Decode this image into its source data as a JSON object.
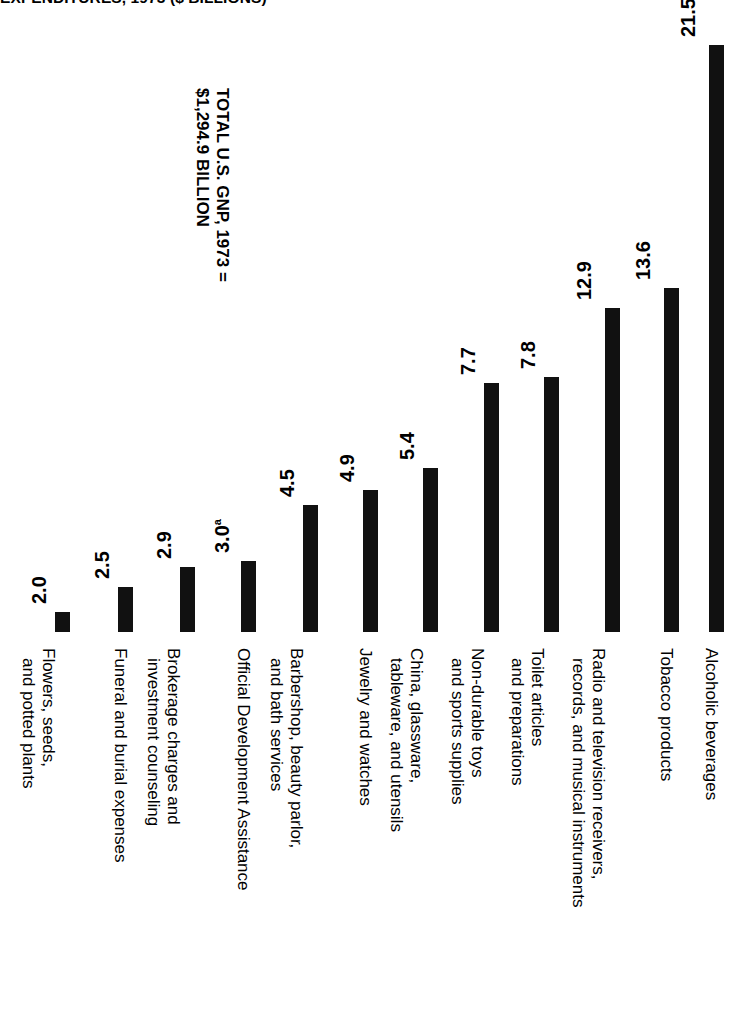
{
  "title": "EXPENDITURES, 1973 ($ BILLIONS)",
  "annotation": {
    "line1": "TOTAL U.S. GNP, 1973 =",
    "line2": "$1,294.9 BILLION"
  },
  "chart_data": {
    "type": "bar",
    "title": "EXPENDITURES, 1973 ($ BILLIONS)",
    "xlabel": "",
    "ylabel": "$ Billions",
    "grid": false,
    "legend": "none",
    "orientation": "vertical",
    "value_labels_rotated": true,
    "categories": [
      "Flowers, seeds, and potted plants",
      "Funeral and burial expenses",
      "Brokerage charges and investment counseling",
      "Official Development Assistance",
      "Barbershop, beauty parlor, and bath services",
      "Jewelry and watches",
      "China, glassware, tableware, and utensils",
      "Non-durable toys and sports supplies",
      "Toilet articles and preparations",
      "Radio and television receivers, records, and musical instruments",
      "Tobacco products",
      "Alcoholic beverages"
    ],
    "category_lines": [
      [
        "Flowers, seeds,",
        "and potted plants"
      ],
      [
        "Funeral and burial expenses"
      ],
      [
        "Brokerage charges and",
        "investment counseling"
      ],
      [
        "Official Development Assistance"
      ],
      [
        "Barbershop, beauty parlor,",
        "and bath services"
      ],
      [
        "Jewelry and watches"
      ],
      [
        "China, glassware,",
        "tableware, and utensils"
      ],
      [
        "Non-durable toys",
        "and sports supplies"
      ],
      [
        "Toilet articles",
        "and preparations"
      ],
      [
        "Radio and television receivers,",
        "records, and musical instruments"
      ],
      [
        "Tobacco products"
      ],
      [
        "Alcoholic beverages"
      ]
    ],
    "values": [
      2.0,
      2.5,
      2.9,
      3.0,
      4.5,
      4.9,
      5.4,
      7.7,
      7.8,
      12.9,
      13.6,
      21.5
    ],
    "value_labels": [
      "2.0",
      "2.5",
      "2.9",
      "3.0",
      "4.5",
      "4.9",
      "5.4",
      "7.7",
      "7.8",
      "12.9",
      "13.6",
      "21.5"
    ],
    "footnote_markers": {
      "3": "a"
    },
    "ylim": [
      0,
      21.5
    ],
    "total_us_gnp_1973": 1294.9,
    "units": "$ billions",
    "year": 1973,
    "bar_color": "#111111"
  },
  "layout": {
    "baseline_y": 632,
    "bar_width": 15,
    "bar_x": [
      55,
      118,
      180,
      241,
      303,
      363,
      423,
      484,
      544,
      605,
      664,
      709
    ],
    "bar_top_y": [
      612,
      587,
      567,
      561,
      505,
      490,
      468,
      383,
      377,
      308,
      288,
      45
    ],
    "cat_x": [
      53,
      116,
      178,
      239,
      301,
      361,
      421,
      482,
      542,
      603,
      662,
      707
    ],
    "cat_two_line_offset": -9
  }
}
